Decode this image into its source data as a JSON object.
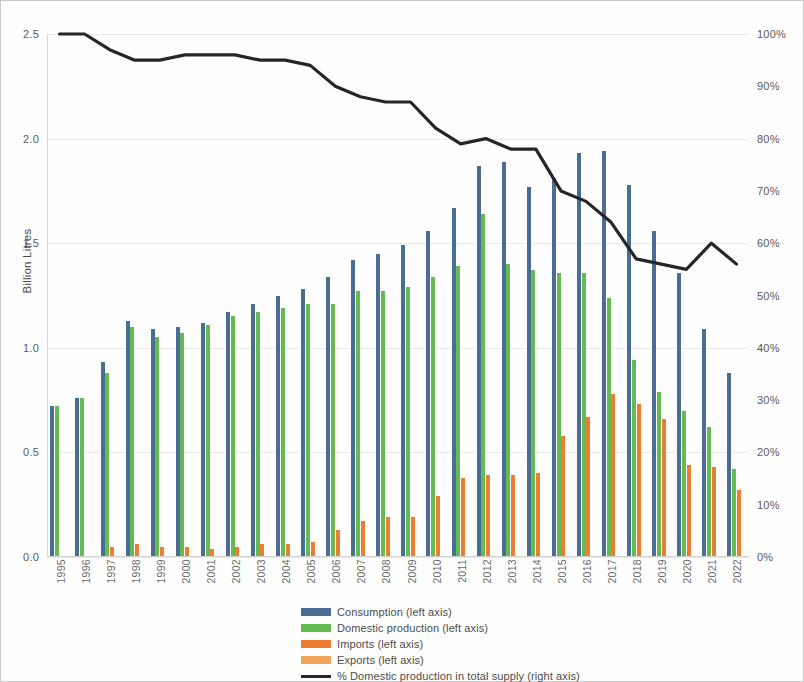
{
  "chart_data": {
    "type": "bar",
    "title": "",
    "xlabel": "",
    "ylabel": "Billion Litres",
    "y2label": "",
    "ylim": [
      0.0,
      2.5
    ],
    "y2lim": [
      0,
      100
    ],
    "grid": true,
    "legend_position": "bottom",
    "left_axis_ticks": [
      "0.0",
      "0.5",
      "1.0",
      "1.5",
      "2.0",
      "2.5"
    ],
    "right_axis_ticks": [
      "0%",
      "10%",
      "20%",
      "30%",
      "40%",
      "50%",
      "60%",
      "70%",
      "80%",
      "90%",
      "100%"
    ],
    "categories": [
      "1995",
      "1996",
      "1997",
      "1998",
      "1999",
      "2000",
      "2001",
      "2002",
      "2003",
      "2004",
      "2005",
      "2006",
      "2007",
      "2008",
      "2009",
      "2010",
      "2011",
      "2012",
      "2013",
      "2014",
      "2015",
      "2016",
      "2017",
      "2018",
      "2019",
      "2020",
      "2021",
      "2022"
    ],
    "series": [
      {
        "name": "Consumption (left axis)",
        "axis": "left",
        "color": "#4A6E93",
        "values": [
          0.72,
          0.76,
          0.93,
          1.13,
          1.09,
          1.1,
          1.12,
          1.17,
          1.21,
          1.25,
          1.28,
          1.34,
          1.42,
          1.45,
          1.49,
          1.56,
          1.67,
          1.87,
          1.89,
          1.77,
          1.81,
          1.93,
          1.94,
          1.78,
          1.56,
          1.36,
          1.09,
          0.88
        ]
      },
      {
        "name": "Domestic production (left axis)",
        "axis": "left",
        "color": "#64BB52",
        "values": [
          0.72,
          0.76,
          0.88,
          1.1,
          1.05,
          1.07,
          1.11,
          1.15,
          1.17,
          1.19,
          1.21,
          1.21,
          1.27,
          1.27,
          1.29,
          1.34,
          1.39,
          1.64,
          1.4,
          1.37,
          1.36,
          1.36,
          1.24,
          0.94,
          0.79,
          0.7,
          0.62,
          0.42
        ]
      },
      {
        "name": "Imports (left axis)",
        "axis": "left",
        "color": "#ED7D31",
        "values": [
          0.0,
          0.0,
          0.05,
          0.06,
          0.05,
          0.05,
          0.04,
          0.05,
          0.06,
          0.06,
          0.07,
          0.13,
          0.17,
          0.19,
          0.19,
          0.29,
          0.38,
          0.39,
          0.39,
          0.4,
          0.58,
          0.67,
          0.78,
          0.73,
          0.66,
          0.44,
          0.43,
          0.32
        ]
      },
      {
        "name": "Exports (left axis)",
        "axis": "left",
        "color": "#F1A55B",
        "values": [
          0.0,
          0.0,
          0.0,
          0.0,
          0.0,
          0.0,
          0.0,
          0.0,
          0.0,
          0.0,
          0.0,
          0.0,
          0.0,
          0.0,
          0.0,
          0.0,
          0.0,
          0.0,
          0.0,
          0.0,
          0.0,
          0.0,
          0.0,
          0.0,
          0.0,
          0.0,
          0.0,
          0.0
        ]
      },
      {
        "name": "% Domestic production in total supply (right axis)",
        "axis": "right",
        "color": "#262626",
        "type": "line",
        "values": [
          100,
          100,
          97,
          95,
          95,
          96,
          96,
          96,
          95,
          95,
          94,
          90,
          88,
          87,
          87,
          82,
          79,
          80,
          78,
          78,
          70,
          68,
          64,
          57,
          56,
          55,
          60,
          56
        ]
      }
    ],
    "legend": [
      {
        "label": "Consumption (left axis)",
        "color": "#4A6E93",
        "marker": "bar"
      },
      {
        "label": "Domestic production (left axis)",
        "color": "#64BB52",
        "marker": "bar"
      },
      {
        "label": "Imports (left axis)",
        "color": "#ED7D31",
        "marker": "bar"
      },
      {
        "label": "Exports (left axis)",
        "color": "#F1A55B",
        "marker": "bar"
      },
      {
        "label": "% Domestic production in total supply (right axis)",
        "color": "#262626",
        "marker": "line"
      }
    ]
  }
}
